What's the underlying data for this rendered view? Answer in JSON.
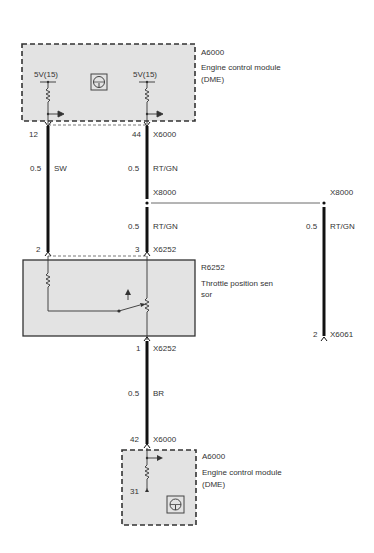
{
  "modules": {
    "top": {
      "id": "A6000",
      "name": "Engine control module",
      "sub": "(DME)",
      "supply_left": "5V(15)",
      "supply_right": "5V(15)"
    },
    "sensor": {
      "id": "R6252",
      "name_line1": "Throttle position sen",
      "name_line2": "sor"
    },
    "bottom": {
      "id": "A6000",
      "name": "Engine  control module",
      "sub": "(DME)",
      "ground_pin": "31"
    }
  },
  "wires": {
    "left": {
      "pin_top": "12",
      "size": "0.5",
      "color": "SW",
      "pin_bottom": "2"
    },
    "middle": {
      "pin_top": "44",
      "connector_top": "X6000",
      "size_upper": "0.5",
      "color_upper": "RT/GN",
      "junction": "X8000",
      "size_lower": "0.5",
      "color_lower": "RT/GN",
      "pin_bottom": "3",
      "connector_bottom": "X6252"
    },
    "right": {
      "junction": "X8000",
      "size": "0.5",
      "color": "RT/GN",
      "pin_bottom": "2",
      "connector_bottom": "X6061"
    },
    "ground": {
      "pin_top": "1",
      "connector_top": "X6252",
      "size": "0.5",
      "color": "BR",
      "pin_bottom": "42",
      "connector_bottom": "X6000"
    }
  },
  "colors": {
    "module_fill": "#e3e3e3",
    "wire": "#111111",
    "border": "#333333"
  }
}
